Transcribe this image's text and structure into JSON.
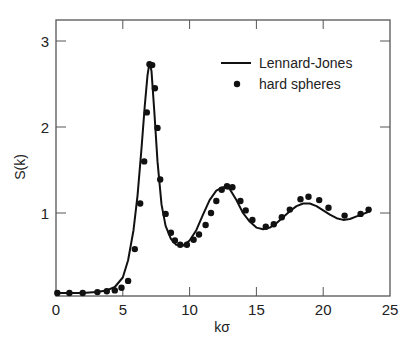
{
  "chart_data": {
    "type": "line",
    "title": "",
    "xlabel": "kσ",
    "ylabel": "S(k)",
    "xlim": [
      0,
      25
    ],
    "ylim": [
      0,
      3.45
    ],
    "xticks": [
      0,
      5,
      10,
      15,
      20,
      25
    ],
    "yticks": [
      1,
      2,
      3
    ],
    "grid": false,
    "legend_position": "upper right",
    "legend": [
      "Lennard-Jones",
      "hard spheres"
    ],
    "series": [
      {
        "name": "Lennard-Jones",
        "style": "line",
        "x": [
          0.0,
          1.0,
          2.0,
          3.0,
          3.8,
          4.4,
          5.0,
          5.4,
          5.8,
          6.1,
          6.4,
          6.65,
          6.85,
          7.0,
          7.15,
          7.35,
          7.6,
          7.9,
          8.2,
          8.6,
          9.0,
          9.5,
          10.0,
          10.5,
          11.0,
          11.5,
          12.0,
          12.5,
          13.0,
          13.5,
          14.0,
          14.5,
          15.0,
          15.5,
          16.0,
          16.5,
          17.0,
          17.5,
          18.0,
          18.5,
          19.0,
          19.5,
          20.0,
          20.5,
          21.0,
          21.5,
          22.0,
          22.5,
          23.0,
          23.5
        ],
        "y": [
          0.07,
          0.07,
          0.07,
          0.08,
          0.1,
          0.14,
          0.25,
          0.45,
          0.8,
          1.2,
          1.75,
          2.25,
          2.6,
          2.75,
          2.65,
          2.2,
          1.6,
          1.1,
          0.85,
          0.7,
          0.63,
          0.62,
          0.68,
          0.8,
          0.98,
          1.15,
          1.26,
          1.3,
          1.28,
          1.15,
          1.0,
          0.9,
          0.83,
          0.81,
          0.83,
          0.88,
          0.95,
          1.02,
          1.08,
          1.11,
          1.11,
          1.08,
          1.03,
          0.98,
          0.94,
          0.92,
          0.93,
          0.96,
          0.99,
          1.02
        ]
      },
      {
        "name": "hard spheres",
        "style": "scatter",
        "x": [
          0.1,
          1.0,
          2.0,
          3.1,
          3.8,
          4.4,
          4.9,
          5.4,
          5.9,
          6.3,
          6.6,
          6.8,
          7.0,
          7.2,
          7.4,
          7.6,
          7.8,
          8.2,
          8.6,
          8.9,
          9.3,
          9.8,
          10.3,
          10.7,
          11.2,
          11.6,
          12.0,
          12.4,
          12.8,
          13.2,
          13.8,
          14.2,
          14.7,
          15.7,
          16.3,
          16.9,
          17.5,
          18.3,
          18.9,
          19.7,
          20.4,
          21.6,
          22.8,
          23.4
        ],
        "y": [
          0.07,
          0.07,
          0.07,
          0.08,
          0.09,
          0.1,
          0.13,
          0.21,
          0.58,
          1.11,
          1.6,
          2.17,
          2.73,
          2.72,
          2.45,
          1.99,
          1.39,
          0.99,
          0.77,
          0.68,
          0.63,
          0.63,
          0.69,
          0.75,
          0.86,
          1.0,
          1.14,
          1.27,
          1.31,
          1.3,
          1.14,
          1.03,
          0.92,
          0.84,
          0.87,
          0.95,
          1.04,
          1.16,
          1.19,
          1.15,
          1.06,
          0.97,
          0.99,
          1.04
        ]
      }
    ]
  }
}
